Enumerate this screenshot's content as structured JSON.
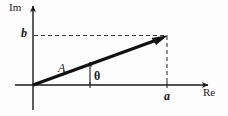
{
  "figure": {
    "title_visible": false,
    "background_color": "#fdfdfd",
    "ink_color": "#1a1a1a",
    "width": 228,
    "height": 116
  },
  "axes": {
    "imaginary": {
      "label": "Im",
      "orientation": "vertical",
      "arrow": "up",
      "origin_x": 33,
      "top_y": 3,
      "bottom_y": 110
    },
    "real": {
      "label": "Re",
      "orientation": "horizontal",
      "arrow": "right",
      "origin_y": 85,
      "left_x": 15,
      "right_x": 212
    }
  },
  "vector": {
    "label": "A",
    "from": {
      "x": 33,
      "y": 85
    },
    "to": {
      "x": 167,
      "y": 36
    },
    "stroke_width": 3,
    "arrowhead": "filled"
  },
  "angle": {
    "label": "θ",
    "description": "angle between real axis and vector A",
    "arc_arrow": "up"
  },
  "projections": {
    "real_component": {
      "label": "a",
      "axis": "Re",
      "tick_x": 167,
      "dashed_line": "vertical from vector tip down to Re axis"
    },
    "imaginary_component": {
      "label": "b",
      "axis": "Im",
      "tick_y": 36,
      "dashed_line": "horizontal from Im axis to vector tip"
    }
  },
  "ticks": [
    {
      "name": "tick-a",
      "x": 167,
      "y": 85
    },
    {
      "name": "tick-theta-base",
      "x": 90,
      "y": 85
    }
  ]
}
